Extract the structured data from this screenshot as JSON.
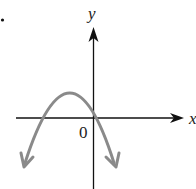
{
  "diagram": {
    "type": "function-graph",
    "bullet": "•",
    "axes": {
      "x_label": "x",
      "y_label": "y",
      "origin_label": "0"
    },
    "curve": {
      "shape": "parabola",
      "opens": "down",
      "vertex_position": "second quadrant (left of y-axis, above x-axis)",
      "y_intercept": "positive",
      "x_intercepts": [
        "negative",
        "positive"
      ],
      "end_arrows": true,
      "color": "#8a8a8a"
    },
    "colors": {
      "axis": "#111111",
      "curve": "#8a8a8a",
      "text": "#222222",
      "background": "#ffffff"
    }
  }
}
